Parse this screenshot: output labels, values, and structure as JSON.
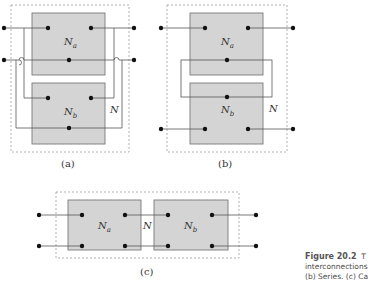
{
  "figure": {
    "number": "Figure 20.2",
    "caption_lines": [
      "T",
      "interconnections",
      "(b) Series. (c) Ca"
    ]
  },
  "panels": [
    {
      "id": "a",
      "label": "(a)",
      "net_a": "N",
      "net_a_sub": "a",
      "net_b": "N",
      "net_b_sub": "b",
      "overall": "N"
    },
    {
      "id": "b",
      "label": "(b)",
      "net_a": "N",
      "net_a_sub": "a",
      "net_b": "N",
      "net_b_sub": "b",
      "overall": "N"
    },
    {
      "id": "c",
      "label": "(c)",
      "net_a": "N",
      "net_a_sub": "a",
      "net_b": "N",
      "net_b_sub": "b",
      "overall": "N"
    }
  ],
  "colors": {
    "box_fill": "#d4d4d4",
    "box_stroke": "#7a7a7a",
    "wire": "#555555",
    "dot": "#111111",
    "dashed": "#a8a8a8"
  }
}
